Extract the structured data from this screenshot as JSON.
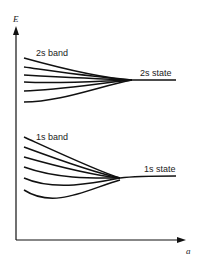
{
  "axes": {
    "y_label": "E",
    "x_label": "a"
  },
  "bands": [
    {
      "band_label": "2s band",
      "state_label": "2s state",
      "curve_count": 6
    },
    {
      "band_label": "1s band",
      "state_label": "1s state",
      "curve_count": 6
    }
  ],
  "colors": {
    "line": "#111111",
    "background": "#ffffff"
  }
}
